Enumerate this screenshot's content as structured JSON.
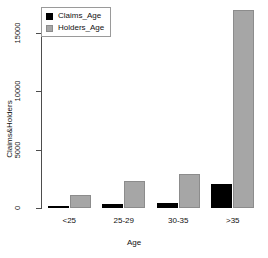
{
  "chart_data": {
    "type": "bar",
    "title": "",
    "xlabel": "Age",
    "ylabel": "Claims&Holders",
    "categories": [
      "<25",
      "25-29",
      "30-35",
      ">35"
    ],
    "series": [
      {
        "name": "Claims_Age",
        "color": "#000000",
        "values": [
          200,
          350,
          420,
          2100
        ]
      },
      {
        "name": "Holders_Age",
        "color": "#a6a6a6",
        "values": [
          1100,
          2300,
          2900,
          17000
        ]
      }
    ],
    "ylim": [
      0,
      17100
    ],
    "yticks": [
      0,
      5000,
      10000,
      15000
    ],
    "ytick_labels": [
      "0",
      "5000",
      "10000",
      "15000"
    ],
    "grid": false,
    "legend_position": "top-left",
    "legend_entries": [
      "Claims_Age",
      "Holders_Age"
    ],
    "axis_color": "#4d4d4d",
    "background": "#ffffff"
  },
  "legend": {
    "items": [
      {
        "label": "Claims_Age"
      },
      {
        "label": "Holders_Age"
      }
    ]
  },
  "axes": {
    "y_title": "Claims&Holders",
    "x_title": "Age",
    "y_ticks": [
      "0",
      "5000",
      "10000",
      "15000"
    ],
    "x_ticks": [
      "<25",
      "25-29",
      "30-35",
      ">35"
    ]
  }
}
